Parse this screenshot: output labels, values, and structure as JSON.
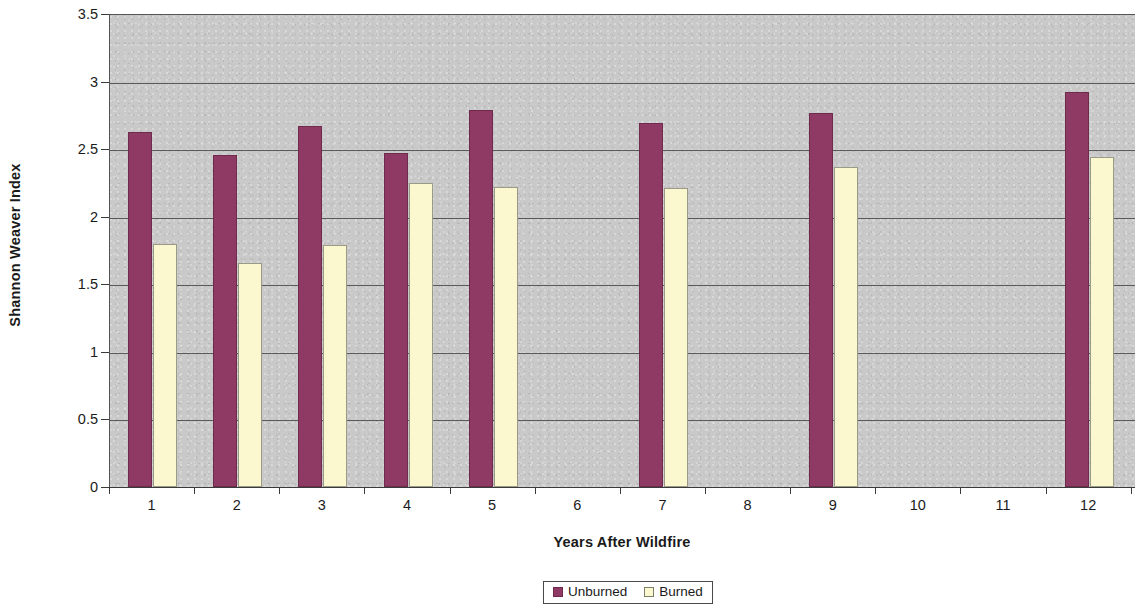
{
  "chart_data": {
    "type": "bar",
    "title": "",
    "xlabel": "Years After Wildfire",
    "ylabel": "Shannon Weaver Index",
    "categories": [
      "1",
      "2",
      "3",
      "4",
      "5",
      "6",
      "7",
      "8",
      "9",
      "10",
      "11",
      "12"
    ],
    "ylim": [
      0,
      3.5
    ],
    "ytick_labels": [
      "0",
      "0.5",
      "1",
      "1.5",
      "2",
      "2.5",
      "3",
      "3.5"
    ],
    "ytick_values": [
      0,
      0.5,
      1,
      1.5,
      2,
      2.5,
      3,
      3.5
    ],
    "grid": "horizontal",
    "legend_position": "bottom-center",
    "plot_background_color": "#c9c9c9",
    "series": [
      {
        "name": "Unburned",
        "color": "#8e3a64",
        "values": [
          2.63,
          2.46,
          2.67,
          2.47,
          2.79,
          null,
          2.69,
          null,
          2.77,
          null,
          null,
          2.92
        ]
      },
      {
        "name": "Burned",
        "color": "#fbf8d0",
        "values": [
          1.8,
          1.66,
          1.79,
          2.25,
          2.22,
          null,
          2.21,
          null,
          2.37,
          null,
          null,
          2.44
        ]
      }
    ]
  },
  "legend": {
    "entries": [
      {
        "label": "Unburned",
        "color": "#8e3a64"
      },
      {
        "label": "Burned",
        "color": "#fbf8d0"
      }
    ]
  }
}
